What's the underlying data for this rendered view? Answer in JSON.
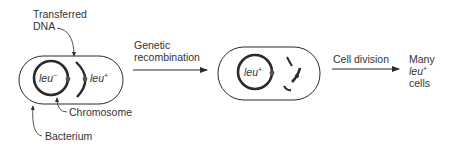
{
  "labels": {
    "transferred_dna_line1": "Transferred",
    "transferred_dna_line2": "DNA",
    "chromosome": "Chromosome",
    "bacterium": "Bacterium",
    "genetic_line1": "Genetic",
    "genetic_line2": "recombination",
    "cell_division": "Cell division",
    "result_line1": "Many",
    "result_line2": "leu",
    "result_line2_sup": "+",
    "result_line3": "cells"
  },
  "cell1": {
    "chromosome_gene": "leu",
    "chromosome_gene_sup": "−",
    "fragment_gene": "leu",
    "fragment_gene_sup": "+"
  },
  "cell2": {
    "chromosome_gene": "leu",
    "chromosome_gene_sup": "+"
  },
  "colors": {
    "line": "#2b2b2b",
    "text": "#333333"
  }
}
